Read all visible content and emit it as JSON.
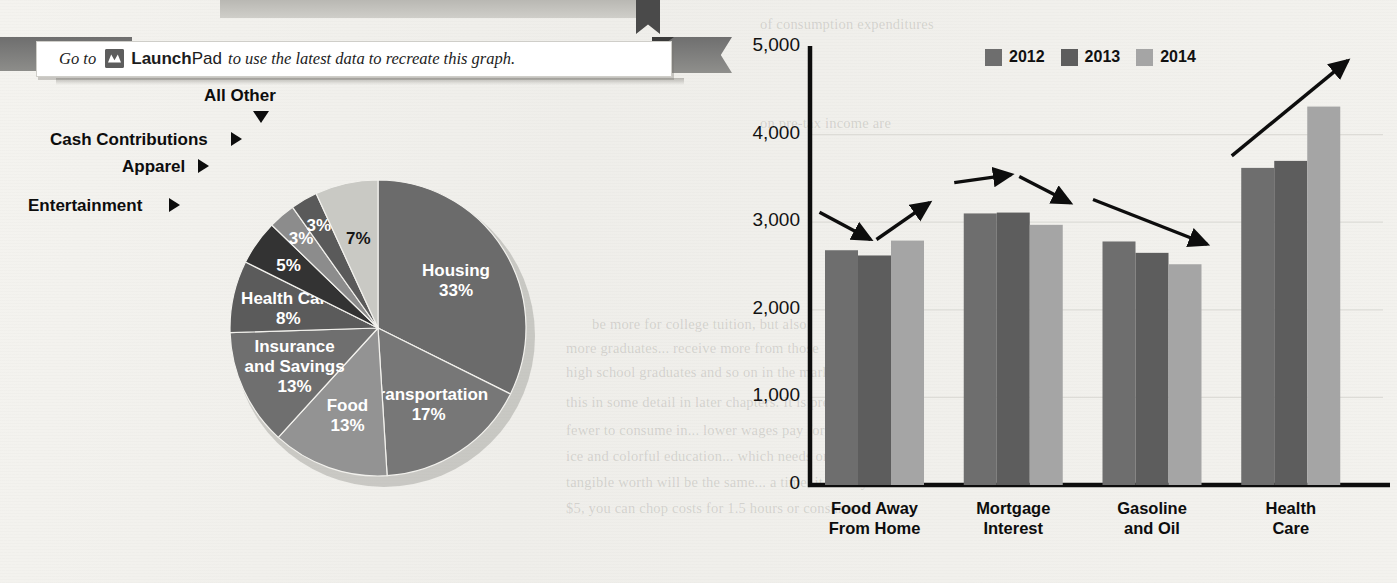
{
  "callout": {
    "prefix": "Go to",
    "icon": "launchpad-icon",
    "brand_bold": "Launch",
    "brand_light": "Pad",
    "suffix": "to use the latest data to recreate this graph."
  },
  "ghost_text": [
    "of consumption expenditures",
    "on pre-tax income are",
    "be more for college tuition, but also",
    "more graduates...  receive more from those",
    "high school graduates and so on in the markets",
    "this in some detail in later chapters. It is present",
    "fewer to consume in... lower wages pay for",
    "ice and colorful education... which needs or costs",
    "tangible worth will be the same... a time, it costs you 25",
    "$5, you can chop costs for 1.5 hours or consume"
  ],
  "pie_chart": {
    "type": "pie",
    "title": "",
    "center": {
      "x": 378,
      "y": 242
    },
    "radius": 148,
    "start_angle_deg": 0,
    "direction": "clockwise",
    "slices": [
      {
        "label": "Housing",
        "value": 33,
        "display": "33%",
        "color": "#6b6b6b",
        "label_inside": true,
        "label_color": "light"
      },
      {
        "label": "Transportation",
        "value": 17,
        "display": "17%",
        "color": "#777777",
        "label_inside": true,
        "label_color": "light"
      },
      {
        "label": "Food",
        "value": 13,
        "display": "13%",
        "color": "#939393",
        "label_inside": true,
        "label_color": "light"
      },
      {
        "label": "Insurance and Savings",
        "value": 13,
        "display": "13%",
        "color": "#6f6f6f",
        "label_inside": true,
        "label_color": "light"
      },
      {
        "label": "Health Care",
        "value": 8,
        "display": "8%",
        "color": "#5b5b5b",
        "label_inside": true,
        "label_color": "light"
      },
      {
        "label": "Entertainment",
        "value": 5,
        "display": "5%",
        "color": "#333333",
        "label_inside": true,
        "label_color": "light"
      },
      {
        "label": "Apparel",
        "value": 3,
        "display": "3%",
        "color": "#8c8c8c",
        "label_inside": true,
        "label_color": "light"
      },
      {
        "label": "Cash Contributions",
        "value": 3,
        "display": "3%",
        "color": "#5a5a5a",
        "label_inside": true,
        "label_color": "light"
      },
      {
        "label": "All Other",
        "value": 7,
        "display": "7%",
        "color": "#c9c9c4",
        "label_inside": true,
        "label_color": "dark"
      }
    ],
    "callouts": [
      {
        "label": "All Other",
        "x": 204,
        "y": 0,
        "caret": "down",
        "caret_x": 253,
        "caret_y": 25
      },
      {
        "label": "Cash Contributions",
        "x": 50,
        "y": 44,
        "caret": "right",
        "caret_x": 231,
        "caret_y": 45
      },
      {
        "label": "Apparel",
        "x": 122,
        "y": 71,
        "caret": "right",
        "caret_x": 198,
        "caret_y": 72
      },
      {
        "label": "Entertainment",
        "x": 28,
        "y": 110,
        "caret": "right",
        "caret_x": 169,
        "caret_y": 111
      }
    ]
  },
  "bar_chart": {
    "type": "bar",
    "title": "",
    "xlabel": "",
    "ylabel": "U.S. Dollars",
    "ylim": [
      0,
      5000
    ],
    "yticks": [
      "0",
      "1,000",
      "2,000",
      "3,000",
      "4,000",
      "5,000"
    ],
    "ytick_values": [
      0,
      1000,
      2000,
      3000,
      4000,
      5000
    ],
    "grid": true,
    "legend_position": "top-right",
    "categories": [
      "Food Away\nFrom Home",
      "Mortgage\nInterest",
      "Gasoline\nand Oil",
      "Health\nCare"
    ],
    "category_labels": [
      [
        "Food Away",
        "From Home"
      ],
      [
        "Mortgage",
        "Interest"
      ],
      [
        "Gasoline",
        "and Oil"
      ],
      [
        "Health",
        "Care"
      ]
    ],
    "series": [
      {
        "name": "2012",
        "color": "#6e6e6e",
        "values": [
          2680,
          3100,
          2780,
          3620
        ]
      },
      {
        "name": "2013",
        "color": "#5d5d5d",
        "values": [
          2620,
          3110,
          2650,
          3700
        ]
      },
      {
        "name": "2014",
        "color": "#a5a5a5",
        "values": [
          2790,
          2970,
          2520,
          4320
        ]
      }
    ],
    "trend_arrows": [
      {
        "group": "Food Away From Home",
        "direction": "down-then-up"
      },
      {
        "group": "Mortgage Interest",
        "direction": "flat-then-down"
      },
      {
        "group": "Gasoline and Oil",
        "direction": "down"
      },
      {
        "group": "Health Care",
        "direction": "up"
      }
    ]
  },
  "colors": {
    "page_background": "#f2f1ed",
    "axis": "#0d0d0d",
    "bar_2012": "#6e6e6e",
    "bar_2013": "#5d5d5d",
    "bar_2014": "#a5a5a5"
  }
}
